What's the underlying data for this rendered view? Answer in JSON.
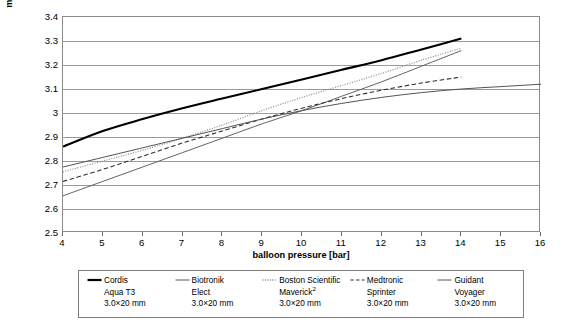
{
  "chart_data": {
    "type": "line",
    "title": "",
    "xlabel": "balloon pressure [bar]",
    "ylabel": "mean balloon diameter [mm]",
    "xlim": [
      4,
      16
    ],
    "ylim": [
      2.5,
      3.4
    ],
    "xticks": [
      "4",
      "5",
      "6",
      "7",
      "8",
      "9",
      "10",
      "11",
      "12",
      "13",
      "14",
      "15",
      "16"
    ],
    "yticks": [
      "3.4",
      "3.3",
      "3.2",
      "3.1",
      "3",
      "2.9",
      "2.8",
      "2.7",
      "2.6",
      "2.5"
    ],
    "grid": true,
    "legend_position": "below",
    "series": [
      {
        "name": "Cordis Aqua T3",
        "style": "solid-thick",
        "color": "#000000",
        "x": [
          4,
          5,
          6,
          7,
          8,
          9,
          10,
          11,
          12,
          13,
          14
        ],
        "y": [
          2.86,
          2.925,
          2.975,
          3.02,
          3.06,
          3.1,
          3.14,
          3.18,
          3.22,
          3.265,
          3.31
        ]
      },
      {
        "name": "Biotronik Elect",
        "style": "solid-thin",
        "color": "#5a5a5a",
        "x": [
          4,
          5,
          6,
          7,
          8,
          9,
          10,
          11,
          12,
          13,
          14
        ],
        "y": [
          2.655,
          2.715,
          2.775,
          2.835,
          2.895,
          2.955,
          3.01,
          3.07,
          3.13,
          3.195,
          3.26
        ]
      },
      {
        "name": "Boston Scientific Maverick²",
        "style": "dotted",
        "color": "#8c8c8c",
        "x": [
          4,
          5,
          6,
          7,
          8,
          9,
          10,
          11,
          12,
          13,
          14
        ],
        "y": [
          2.755,
          2.8,
          2.845,
          2.895,
          2.95,
          3.01,
          3.065,
          3.115,
          3.165,
          3.22,
          3.27
        ]
      },
      {
        "name": "Medtronic Sprinter",
        "style": "dashed",
        "color": "#2b2b2b",
        "x": [
          4,
          5,
          6,
          7,
          8,
          9,
          10,
          11,
          12,
          13,
          14
        ],
        "y": [
          2.715,
          2.765,
          2.82,
          2.875,
          2.925,
          2.975,
          3.02,
          3.06,
          3.095,
          3.125,
          3.15
        ]
      },
      {
        "name": "Guidant Voyager",
        "style": "solid-thin",
        "color": "#4a4a4a",
        "x": [
          4,
          5,
          6,
          7,
          8,
          9,
          10,
          11,
          12,
          13,
          14,
          15,
          16
        ],
        "y": [
          2.775,
          2.815,
          2.855,
          2.895,
          2.935,
          2.975,
          3.01,
          3.04,
          3.065,
          3.085,
          3.1,
          3.11,
          3.12
        ]
      }
    ]
  },
  "legend": {
    "entries": [
      {
        "swatch": "solid-thick-line-icon",
        "name": "Cordis",
        "line2": "Aqua T3",
        "line3": "3.0×20 mm",
        "sup": ""
      },
      {
        "swatch": "solid-thin-line-icon",
        "name": "Biotronik",
        "line2": "Elect",
        "line3": "3.0×20 mm",
        "sup": ""
      },
      {
        "swatch": "dotted-line-icon",
        "name": "Boston Scientific",
        "line2": "Maverick",
        "line3": "3.0×20 mm",
        "sup": "2"
      },
      {
        "swatch": "dashed-line-icon",
        "name": "Medtronic",
        "line2": "Sprinter",
        "line3": "3.0×20 mm",
        "sup": ""
      },
      {
        "swatch": "solid-thin-line-icon",
        "name": "Guidant",
        "line2": "Voyager",
        "line3": "3.0×20 mm",
        "sup": ""
      }
    ]
  },
  "colors": {
    "grid": "#9a9a9a",
    "frame": "#8a8a8a",
    "text": "#000000"
  }
}
